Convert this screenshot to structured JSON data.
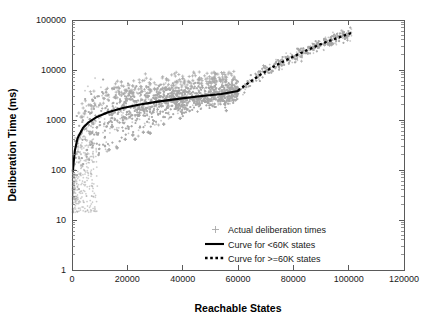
{
  "chart_data": {
    "type": "scatter",
    "title": "",
    "xlabel": "Reachable States",
    "ylabel": "Deliberation Time (ms)",
    "xlim": [
      0,
      120000
    ],
    "ylim": [
      1,
      100000
    ],
    "yscale": "log",
    "xscale": "linear",
    "grid": false,
    "legend_position": "lower-right",
    "xticks": [
      0,
      20000,
      40000,
      60000,
      80000,
      100000,
      120000
    ],
    "xticklabels": [
      "0",
      "20000",
      "40000",
      "60000",
      "80000",
      "100000",
      "120000"
    ],
    "yticks": [
      1,
      10,
      100,
      1000,
      10000,
      100000
    ],
    "yticklabels": [
      "1",
      "10",
      "100",
      "1000",
      "10000",
      "100000"
    ],
    "series": [
      {
        "name": "Actual deliberation times",
        "type": "scatter",
        "marker": "plus",
        "color": "#a9a9a9",
        "description": "Dense cloud of measured deliberation times; rises steeply from ~15 ms near 0 states to a band between ~1000 and ~5000 ms across 10000-60000 states, then climbs to ~50000 ms by 101000 states."
      },
      {
        "name": "Curve for <60K states",
        "type": "line",
        "style": "solid",
        "color": "#000000",
        "x": [
          300,
          1000,
          2000,
          4000,
          6000,
          9000,
          13000,
          18000,
          24000,
          31000,
          39000,
          47000,
          54000,
          60000
        ],
        "y": [
          95,
          240,
          430,
          700,
          900,
          1150,
          1430,
          1720,
          2020,
          2330,
          2680,
          3010,
          3320,
          3800
        ]
      },
      {
        "name": "Curve for >=60K states",
        "type": "line",
        "style": "dotted",
        "color": "#000000",
        "x": [
          60000,
          64000,
          68000,
          72000,
          76000,
          80000,
          85000,
          90000,
          95000,
          101000
        ],
        "y": [
          3900,
          5600,
          8000,
          11000,
          14500,
          18500,
          25000,
          33000,
          42000,
          55000
        ]
      }
    ],
    "legend_entries": [
      {
        "label": "Actual deliberation times",
        "marker": "plus",
        "color": "#a9a9a9"
      },
      {
        "label": "Curve for <60K states",
        "marker": "solid-line",
        "color": "#000000"
      },
      {
        "label": "Curve for >=60K states",
        "marker": "dotted-line",
        "color": "#000000"
      }
    ],
    "colors": {
      "scatter": "#a9a9a9",
      "curve": "#000000",
      "axis": "#5a5a5a",
      "background": "#ffffff"
    }
  }
}
